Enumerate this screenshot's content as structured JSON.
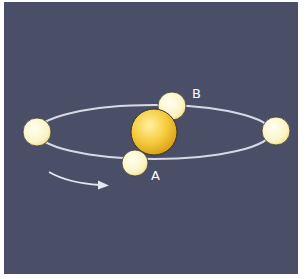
{
  "diagram": {
    "colors": {
      "background": "#4a4e66",
      "border": "#ffffff",
      "orbit": "#d6d9e6",
      "star": "#f1c232",
      "planet": "#fbf4c8",
      "arrow": "#e4e7f0",
      "label": "#ffffff"
    },
    "star": {
      "name": "central-star",
      "cx": 154,
      "cy": 132,
      "r": 23
    },
    "orbit": {
      "cx": 154,
      "cy": 132,
      "rx": 117,
      "ry": 27
    },
    "planets": [
      {
        "name": "planet-left",
        "cx": 37,
        "cy": 132,
        "r": 14,
        "label": ""
      },
      {
        "name": "planet-right",
        "cx": 276,
        "cy": 131,
        "r": 14,
        "label": ""
      },
      {
        "name": "planet-b",
        "cx": 172,
        "cy": 106,
        "r": 14,
        "label": "B"
      },
      {
        "name": "planet-a",
        "cx": 135,
        "cy": 163,
        "r": 13,
        "label": "A"
      }
    ],
    "labels": {
      "a": "A",
      "b": "B"
    },
    "arrow": {
      "direction": "counterclockwise-front-left-to-right",
      "label": ""
    }
  }
}
